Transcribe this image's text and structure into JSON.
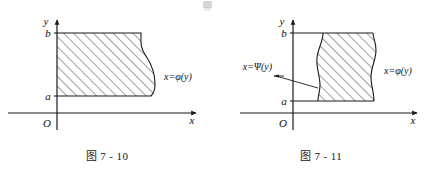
{
  "page": {
    "width": 428,
    "height": 178,
    "background": "#ffffff",
    "ink_color": "#1a1a1a",
    "hatch_color": "#2b2b2b"
  },
  "figures": [
    {
      "id": "figure-7-10",
      "caption": "图 7 - 10",
      "axes": {
        "x_axis_label": "x",
        "y_axis_label": "y",
        "origin_label": "O"
      },
      "ticks": {
        "upper": "b",
        "lower": "a"
      },
      "curves": [
        {
          "name": "right-boundary",
          "label": "x=φ(y)"
        }
      ],
      "region": {
        "fill": "hatched",
        "hatch_angle_deg": 45,
        "description": "region bounded left by the y-axis, above by y=b, below by y=a, right by curve x=phi(y)"
      }
    },
    {
      "id": "figure-7-11",
      "caption": "图 7 - 11",
      "axes": {
        "x_axis_label": "x",
        "y_axis_label": "y",
        "origin_label": "O"
      },
      "ticks": {
        "upper": "b",
        "lower": "a"
      },
      "curves": [
        {
          "name": "left-boundary",
          "label": "x=Ψ(y)"
        },
        {
          "name": "right-boundary",
          "label": "x=φ(y)"
        }
      ],
      "region": {
        "fill": "hatched",
        "hatch_angle_deg": 45,
        "description": "region between curves x=Psi(y) on the left and x=phi(y) on the right, bounded above by y=b and below by y=a"
      }
    }
  ]
}
